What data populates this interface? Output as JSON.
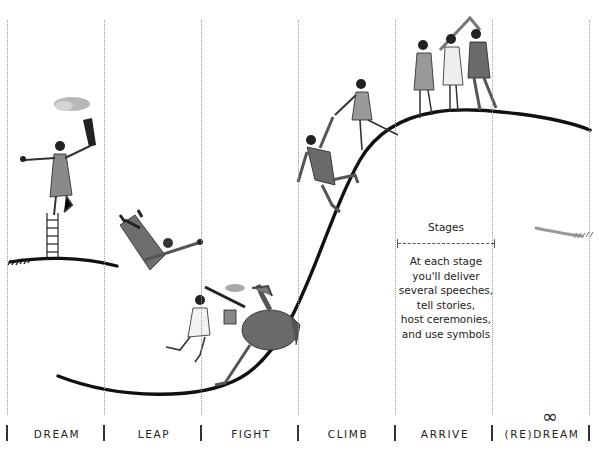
{
  "diagram": {
    "type": "stage-curve",
    "columns": [
      {
        "key": "dream",
        "label": "DREAM",
        "left": 7
      },
      {
        "key": "leap",
        "label": "LEAP",
        "left": 104
      },
      {
        "key": "fight",
        "label": "FIGHT",
        "left": 201
      },
      {
        "key": "climb",
        "label": "CLIMB",
        "left": 298
      },
      {
        "key": "arrive",
        "label": "ARRIVE",
        "left": 395
      },
      {
        "key": "redream",
        "label": "(RE)DREAM",
        "left": 492
      }
    ],
    "redream_symbol": "∞",
    "legend": {
      "title": "Stages",
      "body_lines": [
        "At each stage",
        "you'll deliver",
        "several speeches,",
        "tell stories,",
        "host ceremonies,",
        "and use symbols"
      ]
    },
    "illustrations": [
      {
        "stage": "dream",
        "description": "woman on ladder holding torch"
      },
      {
        "stage": "leap",
        "description": "man falling"
      },
      {
        "stage": "fight",
        "description": "woman with sword and shield fighting dragon"
      },
      {
        "stage": "climb",
        "description": "woman pulling man up the curve"
      },
      {
        "stage": "arrive",
        "description": "group dancing in circle on top"
      },
      {
        "stage": "redream",
        "description": "new curve beginning"
      }
    ],
    "colors": {
      "curve": "#111111",
      "figure_fill": "#7a7a7a",
      "redream_curve": "#999999",
      "divider": "#9a9a9a"
    }
  }
}
